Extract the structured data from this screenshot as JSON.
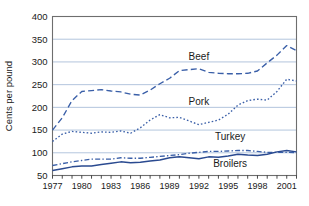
{
  "chart_data": {
    "type": "line",
    "title": "",
    "xlabel": "",
    "ylabel": "Cents per pound",
    "xlim": [
      1977,
      2002
    ],
    "ylim": [
      50,
      400
    ],
    "yticks": [
      50,
      100,
      150,
      200,
      250,
      300,
      350,
      400
    ],
    "xticks": [
      1977,
      1978,
      1979,
      1980,
      1981,
      1982,
      1983,
      1984,
      1985,
      1986,
      1987,
      1988,
      1989,
      1990,
      1991,
      1992,
      1993,
      1994,
      1995,
      1996,
      1997,
      1998,
      1999,
      2000,
      2001,
      2002
    ],
    "xtick_labels_shown": [
      "1977",
      "1980",
      "1983",
      "1986",
      "1989",
      "1992",
      "1995",
      "1998",
      "2001"
    ],
    "grid": "horizontal",
    "legend_position": "inline-annotations",
    "x": [
      1977,
      1978,
      1979,
      1980,
      1981,
      1982,
      1983,
      1984,
      1985,
      1986,
      1987,
      1988,
      1989,
      1990,
      1991,
      1992,
      1993,
      1994,
      1995,
      1996,
      1997,
      1998,
      1999,
      2000,
      2001,
      2002
    ],
    "series": [
      {
        "name": "Beef",
        "color": "#3a5fa8",
        "dash": "long-dash",
        "values": [
          150,
          177,
          215,
          235,
          237,
          239,
          236,
          234,
          229,
          227,
          238,
          252,
          264,
          281,
          283,
          285,
          277,
          275,
          274,
          274,
          275,
          280,
          298,
          315,
          336,
          325
        ]
      },
      {
        "name": "Pork",
        "color": "#3a5fa8",
        "dash": "dotted",
        "values": [
          125,
          141,
          147,
          145,
          143,
          146,
          145,
          148,
          143,
          155,
          172,
          184,
          177,
          178,
          170,
          162,
          167,
          172,
          185,
          205,
          215,
          218,
          216,
          235,
          262,
          258
        ]
      },
      {
        "name": "Turkey",
        "color": "#3a5fa8",
        "dash": "dash-dot",
        "values": [
          72,
          76,
          80,
          83,
          86,
          86,
          86,
          89,
          88,
          88,
          90,
          92,
          94,
          96,
          99,
          101,
          103,
          103,
          104,
          105,
          105,
          103,
          101,
          101,
          101,
          100
        ]
      },
      {
        "name": "Broilers",
        "color": "#2a4a90",
        "dash": "solid",
        "values": [
          61,
          65,
          69,
          71,
          71,
          74,
          77,
          80,
          78,
          79,
          82,
          84,
          89,
          91,
          89,
          87,
          91,
          90,
          93,
          97,
          95,
          94,
          97,
          102,
          105,
          102
        ]
      }
    ],
    "annotations": [
      {
        "text": "Beef",
        "x": 1992,
        "y": 305
      },
      {
        "text": "Pork",
        "x": 1992,
        "y": 205
      },
      {
        "text": "Turkey",
        "x": 1995.2,
        "y": 128
      },
      {
        "text": "Broilers",
        "x": 1995.2,
        "y": 68
      }
    ]
  }
}
